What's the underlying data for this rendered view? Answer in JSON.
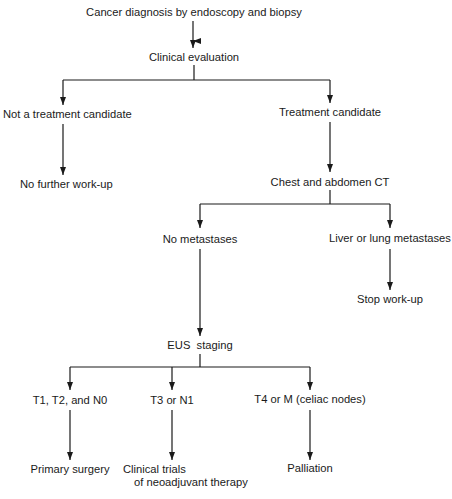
{
  "diagram": {
    "type": "flowchart",
    "nodes": {
      "diagnosis": "Cancer diagnosis by endoscopy and biopsy",
      "clinical_eval": "Clinical evaluation",
      "not_candidate": "Not a treatment candidate",
      "candidate": "Treatment candidate",
      "no_further": "No further work-up",
      "ct": "Chest and abdomen CT",
      "no_mets": "No metastases",
      "liver_lung_mets": "Liver or lung metastases",
      "stop": "Stop work-up",
      "eus": "EUS  staging",
      "t1t2n0": "T1, T2, and N0",
      "t3n1": "T3 or N1",
      "t4m": "T4 or M (celiac nodes)",
      "primary_surgery": "Primary surgery",
      "clinical_trials_line1": "Clinical trials",
      "clinical_trials_line2": "of neoadjuvant therapy",
      "palliation": "Palliation"
    },
    "edges": [
      [
        "diagnosis",
        "clinical_eval"
      ],
      [
        "clinical_eval",
        "not_candidate"
      ],
      [
        "clinical_eval",
        "candidate"
      ],
      [
        "not_candidate",
        "no_further"
      ],
      [
        "candidate",
        "ct"
      ],
      [
        "ct",
        "no_mets"
      ],
      [
        "ct",
        "liver_lung_mets"
      ],
      [
        "liver_lung_mets",
        "stop"
      ],
      [
        "no_mets",
        "eus"
      ],
      [
        "eus",
        "t1t2n0"
      ],
      [
        "eus",
        "t3n1"
      ],
      [
        "eus",
        "t4m"
      ],
      [
        "t1t2n0",
        "primary_surgery"
      ],
      [
        "t3n1",
        "clinical_trials"
      ],
      [
        "t4m",
        "palliation"
      ]
    ],
    "colors": {
      "line": "#1a1a1a",
      "text": "#1a1a1a",
      "background": "#ffffff"
    }
  }
}
